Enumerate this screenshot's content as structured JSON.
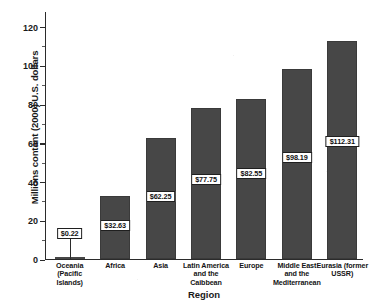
{
  "chart_data": {
    "type": "bar",
    "title": "",
    "xlabel": "Region",
    "ylabel": "Millions contant (2000) U.S. dollars",
    "ylim": [
      0,
      128
    ],
    "yticks": [
      0,
      20,
      40,
      60,
      80,
      100,
      120
    ],
    "ytick_labels": [
      "0",
      "20",
      "40",
      "60",
      "80",
      "100",
      "120"
    ],
    "minor_ticks": [
      10,
      30,
      50,
      70,
      90,
      110
    ],
    "grid": false,
    "legend": null,
    "bar_color": "#474747",
    "categories": [
      "Oceania (Pacific Islands)",
      "Africa",
      "Asia",
      "Latin America and the Caibbean",
      "Europe",
      "Middle East and the Mediterranean",
      "Eurasia (former USSR)"
    ],
    "category_lines": [
      [
        "Oceania",
        "(Pacific",
        "Islands)"
      ],
      [
        "Africa"
      ],
      [
        "Asia"
      ],
      [
        "Latin America",
        "and the",
        "Caibbean"
      ],
      [
        "Europe"
      ],
      [
        "Middle East",
        "and the",
        "Mediterranean"
      ],
      [
        "Eurasia (former",
        "USSR)"
      ]
    ],
    "values": [
      0.22,
      32.63,
      62.25,
      77.75,
      82.55,
      98.19,
      112.31
    ],
    "data_labels": [
      "$0.22",
      "$32.63",
      "$62.25",
      "$77.75",
      "$82.55",
      "$98.19",
      "$112.31"
    ]
  }
}
